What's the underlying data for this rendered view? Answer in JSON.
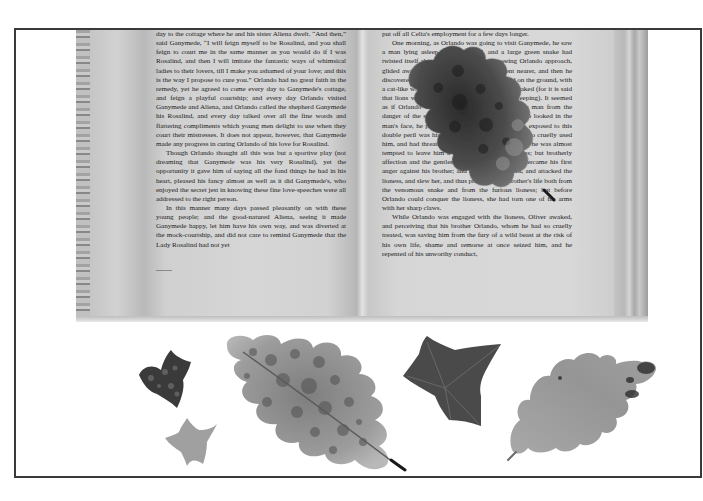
{
  "scene": {
    "description": "Open book with text pages, a dried oak leaf lying on the right page, and five pressed leaves (ivy and oak) arranged below on a white background inside a thin dark frame",
    "colors": {
      "background": "#ffffff",
      "frame": "#3a3a3a",
      "page": "#d4d4d4",
      "text": "#1c1c1c",
      "leaf_dark": "#3d3d3d",
      "leaf_mid": "#8a8a8a",
      "leaf_light": "#b5b5b5"
    }
  },
  "book": {
    "left_page": {
      "paragraphs": [
        "day to the cottage where he and his sister Aliena dwelt. “And then,” said Ganymede, “I will feign myself to be Rosalind, and you shall feign to court me in the same manner as you would do if I was Rosalind, and then I will imitate the fantastic ways of whimsical ladies to their lovers, till I make you ashamed of your love; and this is the way I propose to cure you.” Orlando had no great faith in the remedy, yet he agreed to come every day to Ganymede's cottage, and feign a playful courtship; and every day Orlando visited Ganymede and Aliena, and Orlando called the shepherd Ganymede his Rosalind, and every day talked over all the fine words and flattering compliments which young men delight to use when they court their mistresses. It does not appear, however, that Ganymede made any progress in curing Orlando of his love for Rosalind.",
        "Though Orlando thought all this was but a sportive play (not dreaming that Ganymede was his very Rosalind), yet the opportunity it gave him of saying all the fond things he had in his heart, pleased his fancy almost as well as it did Ganymede's, who enjoyed the secret jest in knowing these fine love-speeches were all addressed to the right person.",
        "In this manner many days passed pleasantly on with these young people; and the good-natured Aliena, seeing it made Ganymede happy, let him have his own way, and was diverted at the mock-courtship, and did not care to remind Ganymede that the Lady Rosalind had not yet"
      ]
    },
    "right_page": {
      "paragraphs": [
        "put off all Celia's employment for a few days longer.",
        "One morning, as Orlando was going to visit Ganymede, he saw a man lying asleep on the ground, and a large green snake had twisted itself about his neck. The snake, seeing Orlando approach, glided away among the bushes. Orlando went nearer, and then he discovered a lioness lie couching, with her head on the ground, with a cat-like watch, waiting till the sleeping man awaked (for it is said that lions will prey on nothing that is dead or sleeping). It seemed as if Orlando was sent by Providence to free the man from the danger of the snake and lioness; but when Orlando looked in the man's face, he perceived that the sleeper who was exposed to this double peril was his own brother Oliver, who had so cruelly used him, and had threatened to destroy him by fire; and he was almost tempted to leave him a prey to the hungry lioness; but brotherly affection and the gentleness of his nature soon overcame his first anger against his brother; and he drew his sword, and attacked the lioness, and slew her, and thus preserved his brother's life both from the venomous snake and from the furious lioness; but before Orlando could conquer the lioness, she had torn one of his arms with her sharp claws.",
        "While Orlando was engaged with the lioness, Oliver awaked, and perceiving that his brother Orlando, whom he had so cruelly treated, was saving him from the fury of a wild beast at the risk of his own life, shame and remorse at once seized him, and he repented of his unworthy conduct,"
      ]
    },
    "leaf_on_page": "dried-oak-leaf"
  },
  "leaves": [
    {
      "name": "small-dark-ivy-leaf",
      "type": "ivy",
      "tone": "dark"
    },
    {
      "name": "small-light-ivy-leaf",
      "type": "ivy",
      "tone": "light"
    },
    {
      "name": "large-mottled-oak-leaf",
      "type": "oak",
      "tone": "mottled"
    },
    {
      "name": "dark-ivy-leaf",
      "type": "ivy",
      "tone": "dark"
    },
    {
      "name": "light-oak-leaf",
      "type": "oak",
      "tone": "light"
    }
  ]
}
